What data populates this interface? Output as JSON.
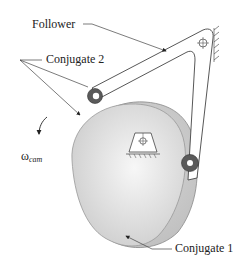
{
  "labels": {
    "follower": "Follower",
    "conjugate2": "Conjugate 2",
    "conjugate1": "Conjugate 1",
    "omega_symbol": "ω",
    "omega_subscript": "cam"
  },
  "colors": {
    "cam_fill_light": "#ececec",
    "cam_fill_mid": "#d6d6d6",
    "cam_back_fill": "#c8c8c8",
    "roller_dark": "#555555",
    "line": "#444444",
    "text": "#222222"
  }
}
